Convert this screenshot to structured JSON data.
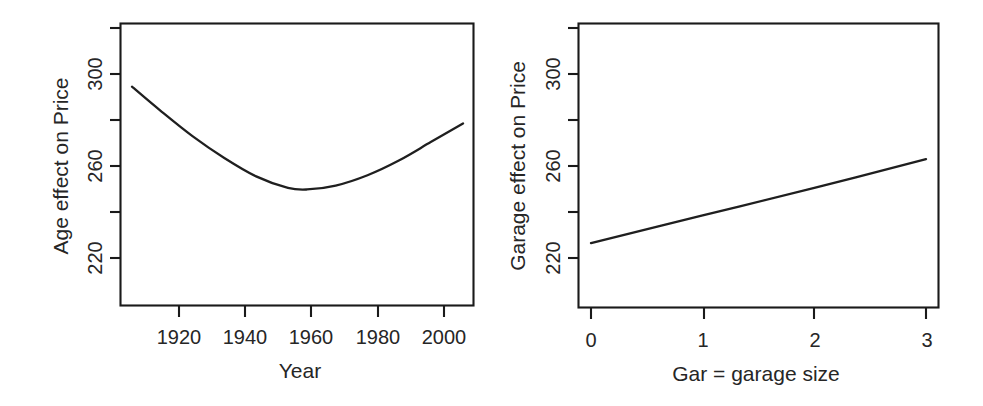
{
  "figure": {
    "kind": "two-panel-effect-plot",
    "background_color": "#ffffff",
    "line_color": "#1f1f1f",
    "axis_color": "#1a1a1a",
    "panel_count": 2
  },
  "chart_data": [
    {
      "type": "line",
      "panel": "left",
      "title": "",
      "xlabel": "Year",
      "ylabel": "Age effect on Price",
      "xlim": [
        1906,
        2011
      ],
      "ylim": [
        210,
        324
      ],
      "xticks": [
        1920,
        1940,
        1960,
        1980,
        2000
      ],
      "xtick_labels": [
        "1920",
        "1940",
        "1960",
        "1980",
        "2000"
      ],
      "yticks": [
        220,
        240,
        260,
        280,
        300,
        320
      ],
      "ytick_labels": [
        "220",
        "",
        "260",
        "",
        "300",
        ""
      ],
      "grid": false,
      "legend": null,
      "shape": "convex-u-curve",
      "x": [
        1906,
        1915,
        1925,
        1935,
        1945,
        1955,
        1961,
        1970,
        1980,
        1990,
        2000,
        2010
      ],
      "y": [
        294.5,
        284.0,
        273.0,
        263.5,
        255.5,
        250.5,
        249.8,
        251.5,
        256.0,
        262.5,
        270.5,
        278.5
      ],
      "annotations": []
    },
    {
      "type": "line",
      "panel": "right",
      "title": "",
      "xlabel": "Gar = garage size",
      "ylabel": "Garage effect on Price",
      "xlim": [
        -0.12,
        3.12
      ],
      "ylim": [
        210,
        324
      ],
      "xticks": [
        0,
        1,
        2,
        3
      ],
      "xtick_labels": [
        "0",
        "1",
        "2",
        "3"
      ],
      "yticks": [
        220,
        240,
        260,
        280,
        300,
        320
      ],
      "ytick_labels": [
        "220",
        "",
        "260",
        "",
        "300",
        ""
      ],
      "grid": false,
      "legend": null,
      "shape": "straight-increasing-line",
      "x": [
        0,
        1,
        2,
        3
      ],
      "y": [
        226.5,
        238.5,
        250.5,
        263.0
      ],
      "annotations": []
    }
  ],
  "left_panel": {
    "name": "Age effect panel",
    "y_axis_title": "Age effect on Price",
    "x_axis_title": "Year",
    "y_labels": [
      "300",
      "260",
      "220"
    ],
    "x_labels": [
      "1920",
      "1940",
      "1960",
      "1980",
      "2000"
    ]
  },
  "right_panel": {
    "name": "Garage effect panel",
    "y_axis_title": "Garage effect on Price",
    "x_axis_title": "Gar = garage size",
    "y_labels": [
      "300",
      "260",
      "220"
    ],
    "x_labels": [
      "0",
      "1",
      "2",
      "3"
    ]
  }
}
